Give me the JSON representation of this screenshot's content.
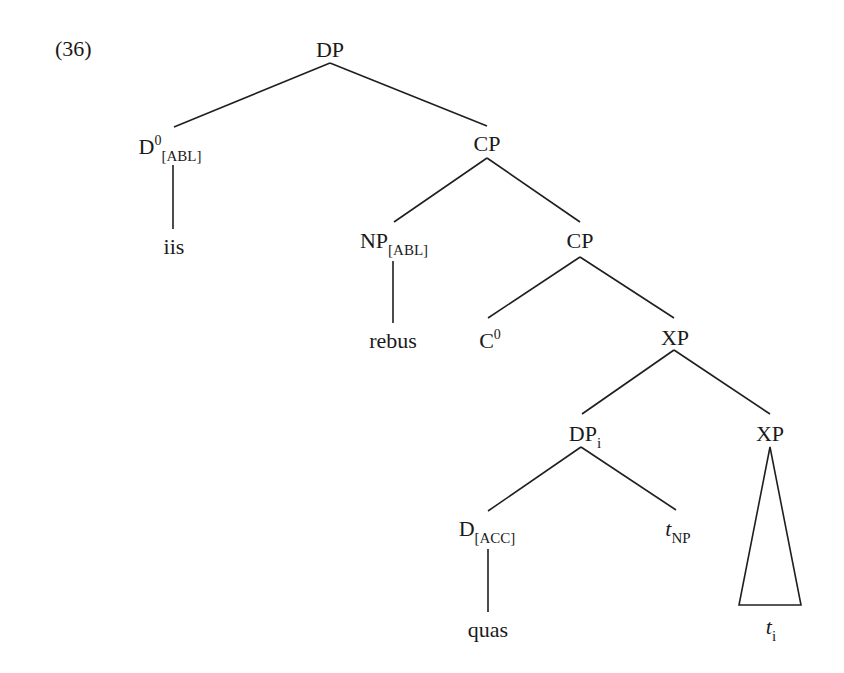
{
  "example_number": "(36)",
  "tree": {
    "root": {
      "label": "DP"
    },
    "d0_abl": {
      "label": "D",
      "sup": "0",
      "sub": "[ABL]"
    },
    "iis": {
      "label": "iis"
    },
    "cp_1": {
      "label": "CP"
    },
    "np_abl": {
      "label": "NP",
      "sub": "[ABL]"
    },
    "rebus": {
      "label": "rebus"
    },
    "cp_2": {
      "label": "CP"
    },
    "c0": {
      "label": "C",
      "sup": "0"
    },
    "xp_1": {
      "label": "XP"
    },
    "dp_i": {
      "label": "DP",
      "sub": "i"
    },
    "xp_2": {
      "label": "XP"
    },
    "d_acc": {
      "label": "D",
      "sub": "[ACC]"
    },
    "quas": {
      "label": "quas"
    },
    "t_np": {
      "label": "t",
      "sub": "NP"
    },
    "t_i": {
      "label": "t",
      "sub": "i"
    }
  },
  "edges": [
    [
      "root",
      "d0_abl"
    ],
    [
      "root",
      "cp_1"
    ],
    [
      "d0_abl",
      "iis"
    ],
    [
      "cp_1",
      "np_abl"
    ],
    [
      "cp_1",
      "cp_2"
    ],
    [
      "np_abl",
      "rebus"
    ],
    [
      "cp_2",
      "c0"
    ],
    [
      "cp_2",
      "xp_1"
    ],
    [
      "xp_1",
      "dp_i"
    ],
    [
      "xp_1",
      "xp_2"
    ],
    [
      "dp_i",
      "d_acc"
    ],
    [
      "dp_i",
      "t_np"
    ],
    [
      "d_acc",
      "quas"
    ],
    [
      "xp_2",
      "t_i",
      "triangle"
    ]
  ]
}
